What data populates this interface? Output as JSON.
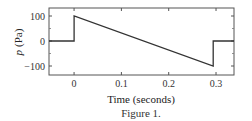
{
  "chart_data": {
    "type": "line",
    "title": "",
    "caption": "Figure 1.",
    "xlabel": "Time (seconds)",
    "ylabel": "p (Pa)",
    "ylabel_symbol": "p",
    "ylabel_unit": "(Pa)",
    "xlim": [
      -0.053,
      0.338
    ],
    "ylim": [
      -130,
      135
    ],
    "grid": false,
    "legend": null,
    "x_ticks": [
      0,
      0.1,
      0.2,
      0.3
    ],
    "x_tick_labels": [
      "0",
      "0.1",
      "0.2",
      "0.3"
    ],
    "y_ticks": [
      100,
      0,
      -100
    ],
    "y_tick_labels": [
      "100",
      "0",
      "−100"
    ],
    "series": [
      {
        "name": "pressure",
        "color": "#333333",
        "x": [
          -0.053,
          0,
          0,
          0.294,
          0.294,
          0.338
        ],
        "y": [
          0,
          0,
          100,
          -100,
          0,
          0
        ]
      }
    ]
  }
}
